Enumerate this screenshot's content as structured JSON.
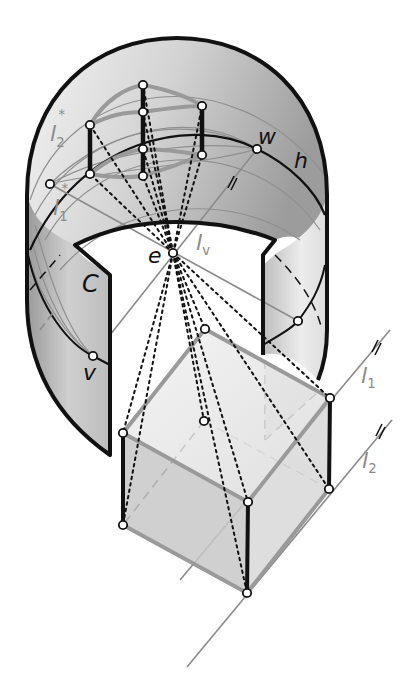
{
  "figure": {
    "labels": {
      "l2_star": {
        "base": "l",
        "sub": "2",
        "sup": "*"
      },
      "l1_star": {
        "base": "l",
        "sub": "1",
        "sup": "*"
      },
      "w": "w",
      "h": "h",
      "e": "e",
      "lv": {
        "base": "l",
        "sub": "v"
      },
      "C": "C",
      "v": "v",
      "l1": {
        "base": "l",
        "sub": "1"
      },
      "l2": {
        "base": "l",
        "sub": "2"
      }
    },
    "colors": {
      "outline": "#111111",
      "guide_gray": "#8a8a8a",
      "cube_edge_gray": "#9a9a9a",
      "surface_light": "#e6e6e6",
      "surface_dark": "#a8a8a8"
    }
  }
}
